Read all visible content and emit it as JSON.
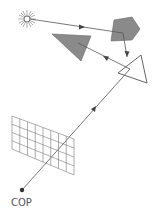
{
  "diagram": {
    "labels": {
      "cop": "COP"
    },
    "elements": {
      "light_source": {
        "name": "sun-icon",
        "x": 27,
        "y": 19
      },
      "pentagon": {
        "fill": "#8a8a8a",
        "points": [
          [
            114,
            20
          ],
          [
            132,
            17
          ],
          [
            140,
            29
          ],
          [
            132,
            40
          ],
          [
            111,
            41
          ]
        ]
      },
      "triangle_grey": {
        "fill": "#8a8a8a",
        "points": [
          [
            52,
            34
          ],
          [
            91,
            36
          ],
          [
            81,
            61
          ]
        ]
      },
      "triangle_outline": {
        "points": [
          [
            118,
            73
          ],
          [
            141,
            55
          ],
          [
            147,
            83
          ]
        ]
      },
      "image_plane_grid": {
        "rows": 4,
        "cols": 8,
        "corners": [
          [
            12,
            116
          ],
          [
            74,
            139
          ],
          [
            74,
            175
          ],
          [
            12,
            149
          ]
        ]
      },
      "cop_point": {
        "x": 22,
        "y": 190
      }
    },
    "colors": {
      "line": "#555555",
      "shape_fill": "#8a8a8a",
      "grid": "#777777"
    }
  }
}
